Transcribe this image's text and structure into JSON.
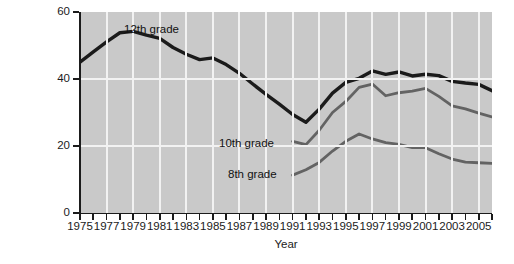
{
  "chart_data": {
    "type": "line",
    "title": "",
    "xlabel": "Year",
    "ylabel": "Percentage of students who reported illicit drug use in the last 12 months",
    "ylabel_line1": "Percentage of students who reported",
    "ylabel_line2": "illicit drug use in the last 12 months",
    "xlim": [
      1975,
      2006
    ],
    "ylim": [
      0,
      60
    ],
    "yticks": [
      0,
      20,
      40,
      60
    ],
    "ytick_labels": [
      "0",
      "20",
      "40",
      "60"
    ],
    "xticks": [
      1975,
      1976,
      1977,
      1978,
      1979,
      1980,
      1981,
      1982,
      1983,
      1984,
      1985,
      1986,
      1987,
      1988,
      1989,
      1990,
      1991,
      1992,
      1993,
      1994,
      1995,
      1996,
      1997,
      1998,
      1999,
      2000,
      2001,
      2002,
      2003,
      2004,
      2005,
      2006
    ],
    "xtick_labels_shown": [
      "1975",
      "1977",
      "1979",
      "1981",
      "1983",
      "1985",
      "1987",
      "1989",
      "1991",
      "1993",
      "1995",
      "1997",
      "1999",
      "2001",
      "2003",
      "2005"
    ],
    "grid": true,
    "grid_color": "#f2f2f2",
    "plot_bg": "#c9c9c9",
    "legend_position": "inline-annotations",
    "series": [
      {
        "name": "12th grade",
        "color": "#1b1b1b",
        "x": [
          1975,
          1976,
          1977,
          1978,
          1979,
          1980,
          1981,
          1982,
          1983,
          1984,
          1985,
          1986,
          1987,
          1988,
          1989,
          1990,
          1991,
          1992,
          1993,
          1994,
          1995,
          1996,
          1997,
          1998,
          1999,
          2000,
          2001,
          2002,
          2003,
          2004,
          2005,
          2006
        ],
        "values": [
          45.0,
          48.1,
          51.1,
          53.8,
          54.2,
          53.1,
          52.1,
          49.4,
          47.4,
          45.8,
          46.3,
          44.3,
          41.7,
          38.5,
          35.4,
          32.5,
          29.4,
          27.1,
          31.0,
          35.8,
          39.0,
          40.2,
          42.4,
          41.4,
          42.1,
          40.9,
          41.4,
          41.0,
          39.3,
          38.8,
          38.4,
          36.5
        ]
      },
      {
        "name": "10th grade",
        "color": "#636363",
        "x": [
          1991,
          1992,
          1993,
          1994,
          1995,
          1996,
          1997,
          1998,
          1999,
          2000,
          2001,
          2002,
          2003,
          2004,
          2005,
          2006
        ],
        "values": [
          21.4,
          20.4,
          24.7,
          30.0,
          33.3,
          37.5,
          38.5,
          35.0,
          35.9,
          36.4,
          37.2,
          34.8,
          32.0,
          31.1,
          29.8,
          28.7
        ]
      },
      {
        "name": "8th grade",
        "color": "#636363",
        "x": [
          1991,
          1992,
          1993,
          1994,
          1995,
          1996,
          1997,
          1998,
          1999,
          2000,
          2001,
          2002,
          2003,
          2004,
          2005,
          2006
        ],
        "values": [
          11.3,
          12.9,
          15.1,
          18.5,
          21.4,
          23.6,
          22.1,
          21.0,
          20.5,
          19.5,
          19.5,
          17.7,
          16.1,
          15.2,
          15.0,
          14.8
        ]
      }
    ],
    "annotations": [
      {
        "label": "12th grade",
        "series": "12th grade"
      },
      {
        "label": "10th grade",
        "series": "10th grade"
      },
      {
        "label": "8th grade",
        "series": "8th grade"
      }
    ]
  }
}
